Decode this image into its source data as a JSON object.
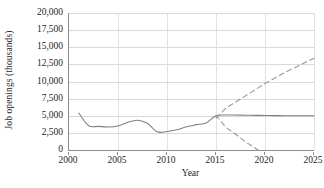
{
  "chart_data": {
    "type": "line",
    "title": "",
    "xlabel": "Year",
    "ylabel": "Job openings (thousands)",
    "xlim": [
      2000,
      2025
    ],
    "ylim": [
      0,
      20000
    ],
    "grid": true,
    "legend": "none",
    "x_ticks": [
      2000,
      2005,
      2010,
      2015,
      2020,
      2025
    ],
    "x_tick_labels": [
      "2000",
      "2005",
      "2010",
      "2015",
      "2020",
      "2025"
    ],
    "y_ticks": [
      0,
      2500,
      5000,
      7500,
      10000,
      12500,
      15000,
      17500,
      20000
    ],
    "y_tick_labels": [
      "0",
      "2,500",
      "5,000",
      "7,500",
      "10,000",
      "12,500",
      "15,000",
      "17,500",
      "20,000"
    ],
    "series": [
      {
        "name": "historical-and-flat-projection",
        "style": "solid",
        "color": "#808080",
        "x": [
          2001,
          2002,
          2003,
          2004,
          2005,
          2006,
          2007,
          2008,
          2009,
          2010,
          2011,
          2012,
          2013,
          2014,
          2015,
          2016,
          2017,
          2018,
          2019,
          2020,
          2021,
          2022,
          2023,
          2024,
          2025
        ],
        "values": [
          5400,
          3550,
          3450,
          3350,
          3500,
          4050,
          4350,
          3900,
          2650,
          2700,
          2950,
          3400,
          3700,
          3950,
          5000,
          5100,
          5100,
          5080,
          5060,
          5040,
          5020,
          5010,
          5000,
          5000,
          5000
        ]
      },
      {
        "name": "upper-projection",
        "style": "dashed",
        "color": "#999999",
        "x": [
          2015,
          2016,
          2017,
          2018,
          2019,
          2020,
          2021,
          2022,
          2023,
          2024,
          2025
        ],
        "values": [
          4700,
          6100,
          7000,
          7900,
          8800,
          9700,
          10500,
          11300,
          12000,
          12700,
          13400
        ]
      },
      {
        "name": "lower-projection",
        "style": "dashed",
        "color": "#999999",
        "x": [
          2015,
          2016,
          2017,
          2018,
          2019.3
        ],
        "values": [
          5100,
          3300,
          2300,
          1200,
          0
        ]
      }
    ]
  }
}
